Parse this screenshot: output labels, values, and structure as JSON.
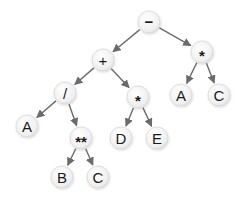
{
  "diagram": {
    "type": "expression-tree",
    "colors": {
      "edge": "#6b6b6b",
      "node_fill": "#f4f4f4",
      "node_stroke": "#d8d8d8",
      "text": "#1a1a1a"
    },
    "nodes": [
      {
        "id": "n0",
        "label": "−",
        "x": 149,
        "y": 22
      },
      {
        "id": "n1",
        "label": "+",
        "x": 103,
        "y": 60
      },
      {
        "id": "n2",
        "label": "*",
        "x": 202,
        "y": 52
      },
      {
        "id": "n3",
        "label": "/",
        "x": 65,
        "y": 93
      },
      {
        "id": "n4",
        "label": "*",
        "x": 138,
        "y": 97
      },
      {
        "id": "n5",
        "label": "A",
        "x": 181,
        "y": 95
      },
      {
        "id": "n6",
        "label": "C",
        "x": 219,
        "y": 95
      },
      {
        "id": "n7",
        "label": "A",
        "x": 27,
        "y": 126
      },
      {
        "id": "n8",
        "label": "**",
        "x": 81,
        "y": 138
      },
      {
        "id": "n9",
        "label": "D",
        "x": 121,
        "y": 138
      },
      {
        "id": "n10",
        "label": "E",
        "x": 157,
        "y": 138
      },
      {
        "id": "n11",
        "label": "B",
        "x": 62,
        "y": 177
      },
      {
        "id": "n12",
        "label": "C",
        "x": 98,
        "y": 177
      }
    ],
    "edges": [
      [
        "n0",
        "n1"
      ],
      [
        "n0",
        "n2"
      ],
      [
        "n1",
        "n3"
      ],
      [
        "n1",
        "n4"
      ],
      [
        "n2",
        "n5"
      ],
      [
        "n2",
        "n6"
      ],
      [
        "n3",
        "n7"
      ],
      [
        "n3",
        "n8"
      ],
      [
        "n4",
        "n9"
      ],
      [
        "n4",
        "n10"
      ],
      [
        "n8",
        "n11"
      ],
      [
        "n8",
        "n12"
      ]
    ]
  }
}
